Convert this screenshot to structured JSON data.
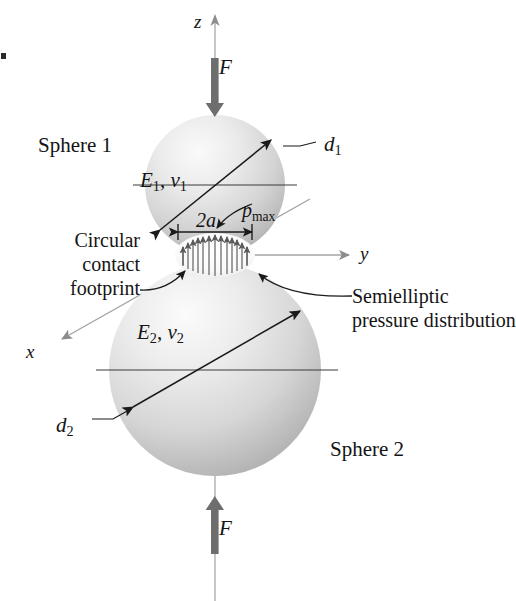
{
  "figure": {
    "labels": {
      "sphere1": "Sphere 1",
      "sphere2": "Sphere 2",
      "force_top": "F",
      "force_bottom": "F",
      "axis_z": "z",
      "axis_y": "y",
      "axis_x": "x",
      "contact_width": "2a",
      "footprint_line1": "Circular",
      "footprint_line2": "contact",
      "footprint_line3": "footprint",
      "pressure_line1": "Semielliptic",
      "pressure_line2": "pressure distribution"
    },
    "material_sphere1": {
      "modulus": "E",
      "modulus_sub": "1",
      "poisson": "v",
      "poisson_sub": "1",
      "separator": ", "
    },
    "material_sphere2": {
      "modulus": "E",
      "modulus_sub": "2",
      "poisson": "v",
      "poisson_sub": "2",
      "separator": ", "
    },
    "diameter_sphere1": {
      "symbol": "d",
      "sub": "1"
    },
    "diameter_sphere2": {
      "symbol": "d",
      "sub": "2"
    },
    "pressure_peak": {
      "symbol": "p",
      "sub": "max"
    },
    "colors": {
      "ink": "#141414",
      "force_arrow": "#6e6e6e",
      "axis_line": "#9a9a9a",
      "sphere_light": "#f2f2f2",
      "sphere_mid": "#d2d2d2",
      "sphere_dark": "#a8a8a8",
      "background": "#ffffff"
    },
    "geometry": {
      "sphere1_center": [
        215,
        185
      ],
      "sphere1_radius": 70,
      "sphere2_center": [
        215,
        370
      ],
      "sphere2_radius": 106,
      "contact_point": [
        215,
        255
      ],
      "contact_half_width_px": 38,
      "pressure_arrow_count": 13
    }
  }
}
